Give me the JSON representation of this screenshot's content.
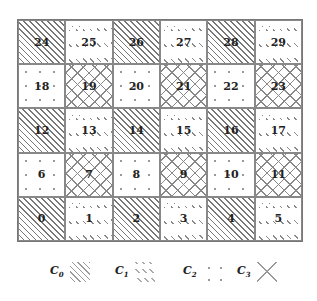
{
  "grid": {
    "rows": 5,
    "cols": 6,
    "cells": [
      [
        {
          "label": "24",
          "class": "C0"
        },
        {
          "label": "25",
          "class": "C1"
        },
        {
          "label": "26",
          "class": "C0"
        },
        {
          "label": "27",
          "class": "C1"
        },
        {
          "label": "28",
          "class": "C0"
        },
        {
          "label": "29",
          "class": "C1"
        }
      ],
      [
        {
          "label": "18",
          "class": "C2"
        },
        {
          "label": "19",
          "class": "C3"
        },
        {
          "label": "20",
          "class": "C2"
        },
        {
          "label": "21",
          "class": "C3"
        },
        {
          "label": "22",
          "class": "C2"
        },
        {
          "label": "23",
          "class": "C3"
        }
      ],
      [
        {
          "label": "12",
          "class": "C0"
        },
        {
          "label": "13",
          "class": "C1"
        },
        {
          "label": "14",
          "class": "C0"
        },
        {
          "label": "15",
          "class": "C1"
        },
        {
          "label": "16",
          "class": "C0"
        },
        {
          "label": "17",
          "class": "C1"
        }
      ],
      [
        {
          "label": "6",
          "class": "C2"
        },
        {
          "label": "7",
          "class": "C3"
        },
        {
          "label": "8",
          "class": "C2"
        },
        {
          "label": "9",
          "class": "C3"
        },
        {
          "label": "10",
          "class": "C2"
        },
        {
          "label": "11",
          "class": "C3"
        }
      ],
      [
        {
          "label": "0",
          "class": "C0"
        },
        {
          "label": "1",
          "class": "C1"
        },
        {
          "label": "2",
          "class": "C0"
        },
        {
          "label": "3",
          "class": "C1"
        },
        {
          "label": "4",
          "class": "C0"
        },
        {
          "label": "5",
          "class": "C1"
        }
      ]
    ]
  },
  "legend": [
    {
      "letter": "C",
      "sub": "0",
      "class": "C0",
      "pattern": "diagonal-hatch",
      "x": 50
    },
    {
      "letter": "C",
      "sub": "1",
      "class": "C1",
      "pattern": "dashed-hatch",
      "x": 115
    },
    {
      "letter": "C",
      "sub": "2",
      "class": "C2",
      "pattern": "dots",
      "x": 183
    },
    {
      "letter": "C",
      "sub": "3",
      "class": "C3",
      "pattern": "cross",
      "x": 237
    }
  ]
}
